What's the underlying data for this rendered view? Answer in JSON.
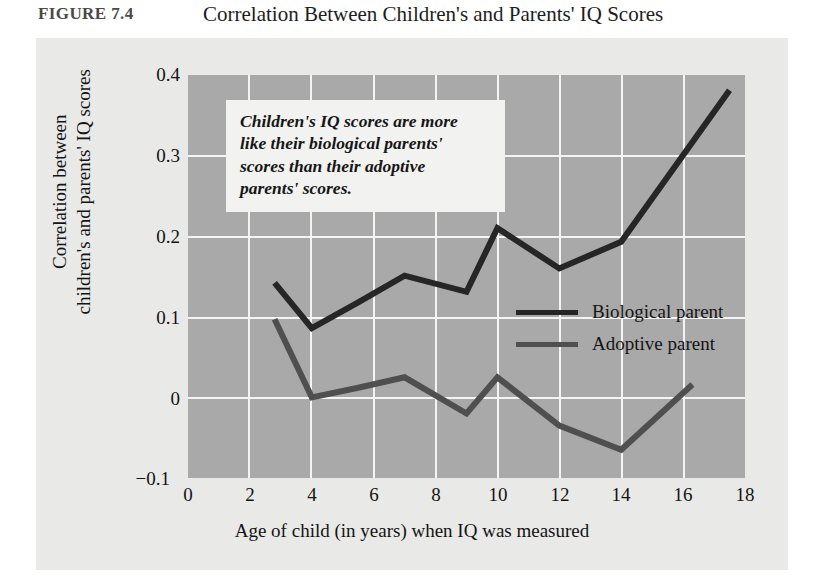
{
  "figure": {
    "label": "FIGURE 7.4",
    "title": "Correlation Between Children's and Parents' IQ Scores"
  },
  "annotation": {
    "line1": "Children's IQ scores are more",
    "line2": "like their biological parents'",
    "line3": "scores than their adoptive",
    "line4": "parents' scores."
  },
  "legend": {
    "biological": "Biological parent",
    "adoptive": "Adoptive parent"
  },
  "axes": {
    "ylabel_line1": "Correlation between",
    "ylabel_line2": "children's and parents' IQ scores",
    "xlabel": "Age of child (in years) when IQ was measured",
    "yticks": [
      "0.4",
      "0.3",
      "0.2",
      "0.1",
      "0",
      "−0.1"
    ],
    "xticks": [
      "0",
      "2",
      "4",
      "6",
      "8",
      "10",
      "12",
      "14",
      "16",
      "18"
    ]
  },
  "colors": {
    "plot_background": "#a9a9a9",
    "card_background": "#e9e9e7",
    "gridline": "#f4f4f2",
    "biological_line": "#262626",
    "adoptive_line": "#4f4f4f",
    "annotation_background": "#f2f2f0",
    "text": "#141414"
  },
  "chart_data": {
    "type": "line",
    "title": "Correlation Between Children's and Parents' IQ Scores",
    "xlabel": "Age of child (in years) when IQ was measured",
    "ylabel": "Correlation between children's and parents' IQ scores",
    "xlim": [
      0,
      18
    ],
    "ylim": [
      -0.1,
      0.4
    ],
    "xticks": [
      0,
      2,
      4,
      6,
      8,
      10,
      12,
      14,
      16,
      18
    ],
    "yticks": [
      -0.1,
      0,
      0.1,
      0.2,
      0.3,
      0.4
    ],
    "grid": true,
    "legend_position": "center-right",
    "series": [
      {
        "name": "Biological parent",
        "color": "#262626",
        "x": [
          2.8,
          4,
          5.5,
          7,
          9,
          10,
          12,
          14,
          17.5
        ],
        "y": [
          0.142,
          0.086,
          0.118,
          0.151,
          0.131,
          0.21,
          0.16,
          0.193,
          0.381
        ]
      },
      {
        "name": "Adoptive parent",
        "color": "#4f4f4f",
        "x": [
          2.8,
          4,
          5.5,
          7,
          9,
          10,
          12,
          14,
          16.3
        ],
        "y": [
          0.097,
          0.0,
          0.012,
          0.025,
          -0.02,
          0.025,
          -0.035,
          -0.065,
          0.016
        ]
      }
    ]
  }
}
